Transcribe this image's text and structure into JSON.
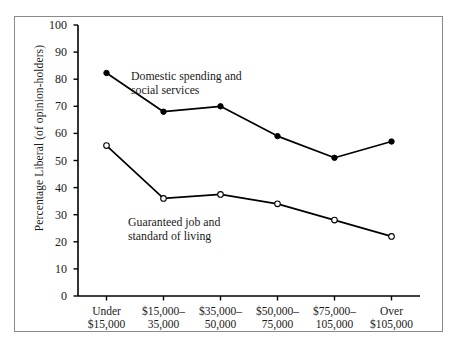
{
  "chart_data": {
    "type": "line",
    "title": "",
    "xlabel": "",
    "ylabel": "Percentage Liberal (of opinion-holders)",
    "ylim": [
      0,
      100
    ],
    "ytick_values": [
      0,
      10,
      20,
      30,
      40,
      50,
      60,
      70,
      80,
      90,
      100
    ],
    "ytick_labels": [
      "0",
      "10",
      "20",
      "30",
      "40",
      "50",
      "60",
      "70",
      "80",
      "90",
      "100"
    ],
    "grid": false,
    "legend_position": "inline-annotations",
    "categories": [
      "Under\n$15,000",
      "$15,000–\n35,000",
      "$35,000–\n50,000",
      "$50,000–\n75,000",
      "$75,000–\n105,000",
      "Over\n$105,000"
    ],
    "category_lines": [
      [
        "Under",
        "$15,000"
      ],
      [
        "$15,000–",
        "35,000"
      ],
      [
        "$35,000–",
        "50,000"
      ],
      [
        "$50,000–",
        "75,000"
      ],
      [
        "$75,000–",
        "105,000"
      ],
      [
        "Over",
        "$105,000"
      ]
    ],
    "series": [
      {
        "name": "Domestic spending and social services",
        "annotation_lines": [
          "Domestic spending and",
          "social services"
        ],
        "marker": "filled-circle",
        "color": "#000000",
        "values": [
          82.3,
          68.0,
          70.0,
          59.0,
          51.0,
          57.0
        ]
      },
      {
        "name": "Guaranteed job and standard of living",
        "annotation_lines": [
          "Guaranteed job and",
          "standard of living"
        ],
        "marker": "open-circle",
        "color": "#000000",
        "values": [
          55.5,
          36.0,
          37.5,
          34.0,
          28.0,
          22.0
        ]
      }
    ]
  },
  "colors": {
    "line": "#111111",
    "axis": "#000000",
    "frame": "#8a8a8a",
    "background": "#ffffff"
  }
}
